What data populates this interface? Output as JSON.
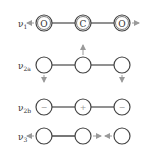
{
  "diagram": {
    "colors": {
      "stroke": "#555555",
      "arrow": "#9a9a9a",
      "text": "#333333"
    },
    "modes": [
      {
        "label": "ν",
        "subscript": "1",
        "atoms": [
          "O",
          "C",
          "O"
        ],
        "displacements": [
          "left",
          "none",
          "right"
        ],
        "notes": "symmetric stretch"
      },
      {
        "label": "ν",
        "subscript": "2a",
        "atoms": [
          "",
          "",
          ""
        ],
        "displacements": [
          "down",
          "up",
          "down"
        ],
        "notes": "bending in-plane"
      },
      {
        "label": "ν",
        "subscript": "2b",
        "atoms": [
          "−",
          "+",
          "−"
        ],
        "displacements": [
          "out",
          "in",
          "out"
        ],
        "notes": "bending out-of-plane"
      },
      {
        "label": "ν",
        "subscript": "3",
        "atoms": [
          "",
          "",
          ""
        ],
        "displacements": [
          "left",
          "right",
          "left"
        ],
        "notes": "asymmetric stretch"
      }
    ]
  }
}
